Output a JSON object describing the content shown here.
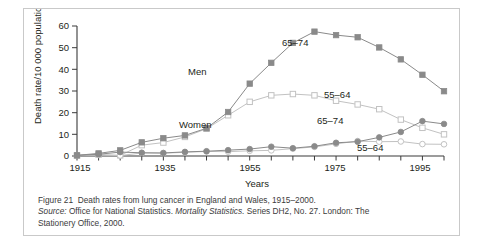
{
  "figure": {
    "caption_label": "Figure 21",
    "caption_text": "Death rates from lung cancer in England and Wales, 1915–2000.",
    "source_label": "Source:",
    "source_text_a": "Office for National Statistics.",
    "source_italic_title": "Mortality Statistics.",
    "source_text_b": "Series DH2, No. 27. London: The",
    "source_text_c": "Stationery Office, 2000."
  },
  "colors": {
    "axis": "#3a3a3a",
    "men_65_74": "#8a8a8a",
    "men_55_64": "#c2c2c2",
    "women_65_74": "#8a8a8a",
    "women_55_64": "#c2c2c2",
    "frame": "#c9c9c9",
    "text": "#231f20"
  },
  "annotations": {
    "men": "Men",
    "women": "Women",
    "men_65_74": "65–74",
    "men_55_64": "55–64",
    "women_65_74": "65–74",
    "women_55_64": "55–64"
  },
  "chart_data": {
    "type": "line",
    "title": "Death rates from lung cancer in England and Wales, 1915–2000",
    "xlabel": "Years",
    "ylabel": "Death rate/10 000 population",
    "xlim": [
      1915,
      2000
    ],
    "ylim": [
      0,
      60
    ],
    "grid": false,
    "legend": "inline-annotations",
    "xticks_major": [
      1915,
      1935,
      1955,
      1975,
      1995
    ],
    "xticks_minor": [
      1920,
      1925,
      1930,
      1940,
      1945,
      1950,
      1960,
      1965,
      1970,
      1980,
      1985,
      1990,
      2000
    ],
    "yticks": [
      0,
      10,
      20,
      30,
      40,
      50,
      60
    ],
    "x": [
      1915,
      1920,
      1925,
      1930,
      1935,
      1940,
      1945,
      1950,
      1955,
      1960,
      1965,
      1970,
      1975,
      1980,
      1985,
      1990,
      1995,
      2000
    ],
    "series": [
      {
        "name": "Men 65–74",
        "marker": "filled-square",
        "color": "#8a8a8a",
        "values": [
          0.3,
          1.2,
          2.6,
          6.3,
          8.2,
          9.5,
          12.8,
          20.3,
          33.4,
          43.0,
          52.2,
          57.4,
          55.8,
          54.8,
          50.1,
          44.6,
          37.5,
          29.9
        ]
      },
      {
        "name": "Men 55–64",
        "marker": "open-square",
        "color": "#c2c2c2",
        "values": [
          0.2,
          0.6,
          0.3,
          5.0,
          6.2,
          8.8,
          12.6,
          18.8,
          25.0,
          28.0,
          28.6,
          28.0,
          25.5,
          23.8,
          21.6,
          16.8,
          13.0,
          10.0
        ]
      },
      {
        "name": "Women 65–74",
        "marker": "filled-circle",
        "color": "#8a8a8a",
        "values": [
          0.3,
          0.8,
          1.8,
          1.5,
          1.4,
          1.9,
          2.2,
          2.7,
          3.2,
          4.3,
          3.6,
          4.5,
          6.1,
          6.6,
          8.6,
          11.1,
          14.0,
          15.6
        ]
      },
      {
        "name": "Women 55–64",
        "marker": "open-circle",
        "color": "#c2c2c2",
        "values": [
          0.2,
          0.5,
          0.2,
          1.4,
          1.3,
          1.7,
          2.1,
          2.0,
          2.4,
          2.6,
          3.4,
          4.2,
          5.6,
          6.9,
          6.6,
          6.7,
          5.5,
          5.4
        ]
      }
    ],
    "series_extra": [
      {
        "name": "Women 65–74 tail",
        "x": [
          1995,
          2000
        ],
        "values": [
          16.1,
          14.8
        ]
      }
    ]
  }
}
